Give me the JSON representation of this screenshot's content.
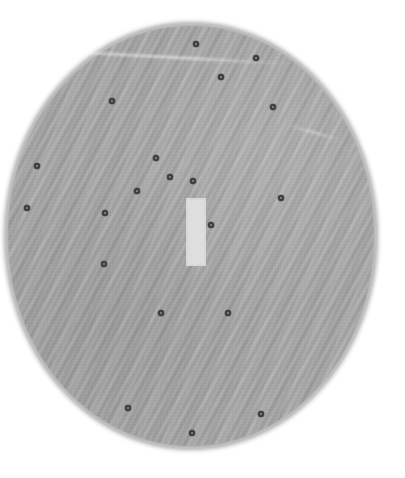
{
  "view": {
    "width": 405,
    "height": 478,
    "background_color": "#ffffff",
    "title": "Speckled Disc Scan"
  },
  "disc": {
    "name": "textured-gray-disc",
    "shape": "ellipse",
    "center_x": 191,
    "center_y": 236,
    "radius_x": 183,
    "radius_y": 210,
    "fill_color": "#a2a2a2",
    "edge": "ragged-fuzzy",
    "texture": "diagonal-brush-streaks"
  },
  "center_patch": {
    "name": "pale-vertical-rectangle",
    "x": 186,
    "y": 198,
    "width": 20,
    "height": 68,
    "fill_color": "#dedede"
  },
  "streaks": [
    {
      "name": "top-bright-streak",
      "x": 57,
      "y": 56,
      "length": 235,
      "angle_deg": 3.1,
      "color": "#ffffff"
    },
    {
      "name": "mid-bright-streak",
      "x": 285,
      "y": 131,
      "length": 58,
      "angle_deg": 16,
      "color": "#ffffff"
    }
  ],
  "markers": {
    "name": "dark-ring-markers",
    "count": 21,
    "ring_color": "#3c3f42",
    "core_color": "#8e9093",
    "diameter_px": 6,
    "points": [
      {
        "id": 1,
        "x": 196,
        "y": 44
      },
      {
        "id": 2,
        "x": 256,
        "y": 58
      },
      {
        "id": 3,
        "x": 221,
        "y": 77
      },
      {
        "id": 4,
        "x": 112,
        "y": 101
      },
      {
        "id": 5,
        "x": 273,
        "y": 107
      },
      {
        "id": 6,
        "x": 37,
        "y": 166
      },
      {
        "id": 7,
        "x": 156,
        "y": 158
      },
      {
        "id": 8,
        "x": 170,
        "y": 177
      },
      {
        "id": 9,
        "x": 193,
        "y": 181
      },
      {
        "id": 10,
        "x": 137,
        "y": 191
      },
      {
        "id": 11,
        "x": 281,
        "y": 198
      },
      {
        "id": 12,
        "x": 27,
        "y": 208
      },
      {
        "id": 13,
        "x": 105,
        "y": 213
      },
      {
        "id": 14,
        "x": 211,
        "y": 225
      },
      {
        "id": 15,
        "x": 104,
        "y": 264
      },
      {
        "id": 16,
        "x": 161,
        "y": 313
      },
      {
        "id": 17,
        "x": 228,
        "y": 313
      },
      {
        "id": 18,
        "x": 128,
        "y": 408
      },
      {
        "id": 19,
        "x": 261,
        "y": 414
      },
      {
        "id": 20,
        "x": 192,
        "y": 433
      },
      {
        "id": 21,
        "x": 281,
        "y": 198
      }
    ]
  }
}
